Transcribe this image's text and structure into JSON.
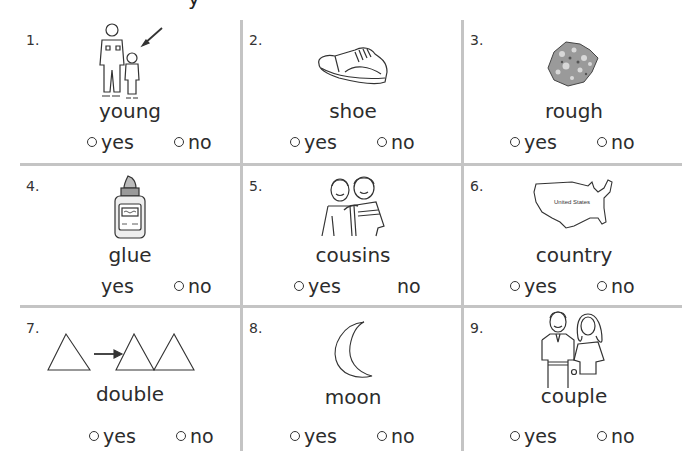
{
  "worksheet": {
    "cutoff_heading_fragment": "y",
    "items": [
      {
        "number": "1.",
        "word": "young",
        "picture": "grandfather-and-child-with-arrow",
        "options": [
          {
            "label": "yes",
            "circle": true
          },
          {
            "label": "no",
            "circle": true
          }
        ]
      },
      {
        "number": "2.",
        "word": "shoe",
        "picture": "sneaker",
        "options": [
          {
            "label": "yes",
            "circle": true
          },
          {
            "label": "no",
            "circle": true
          }
        ]
      },
      {
        "number": "3.",
        "word": "rough",
        "picture": "rock",
        "options": [
          {
            "label": "yes",
            "circle": true
          },
          {
            "label": "no",
            "circle": true
          }
        ]
      },
      {
        "number": "4.",
        "word": "glue",
        "picture": "glue-bottle",
        "options": [
          {
            "label": "yes",
            "circle": false
          },
          {
            "label": "no",
            "circle": true
          }
        ]
      },
      {
        "number": "5.",
        "word": "cousins",
        "picture": "two-boys",
        "options": [
          {
            "label": "yes",
            "circle": true
          },
          {
            "label": "no",
            "circle": false
          }
        ]
      },
      {
        "number": "6.",
        "word": "country",
        "picture": "united-states-map",
        "map_label": "United States",
        "options": [
          {
            "label": "yes",
            "circle": true
          },
          {
            "label": "no",
            "circle": true
          }
        ]
      },
      {
        "number": "7.",
        "word": "double",
        "picture": "triangle-doubling",
        "options": [
          {
            "label": "yes",
            "circle": true
          },
          {
            "label": "no",
            "circle": true
          }
        ]
      },
      {
        "number": "8.",
        "word": "moon",
        "picture": "crescent-moon",
        "options": [
          {
            "label": "yes",
            "circle": true
          },
          {
            "label": "no",
            "circle": true
          }
        ]
      },
      {
        "number": "9.",
        "word": "couple",
        "picture": "man-and-woman",
        "options": [
          {
            "label": "yes",
            "circle": true
          },
          {
            "label": "no",
            "circle": true
          }
        ]
      }
    ]
  }
}
